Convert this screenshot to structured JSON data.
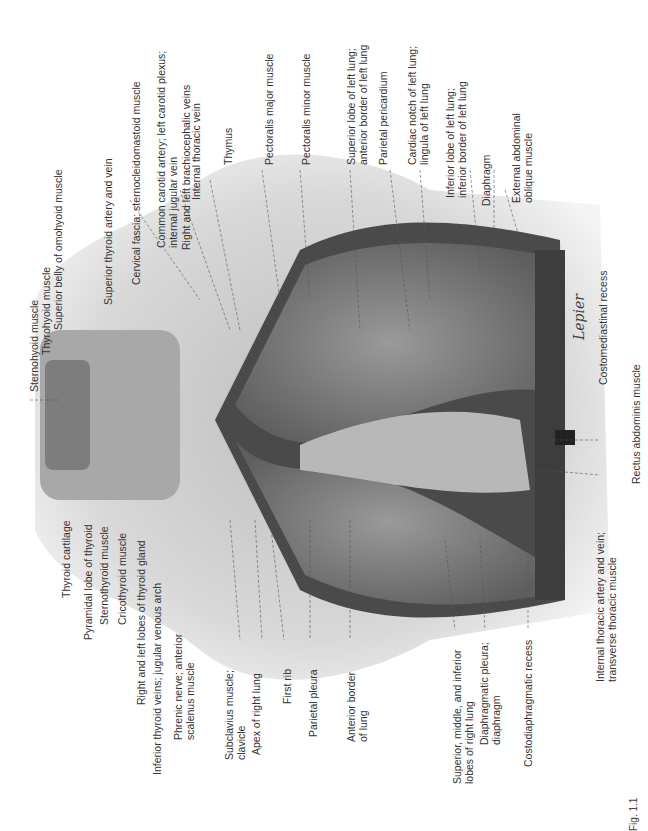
{
  "figure": {
    "caption_fragment": "Fig. 1.1",
    "signature": "Lepier"
  },
  "labels_top": [
    {
      "id": "sternohyoid",
      "text": "Sternohyoid muscle"
    },
    {
      "id": "thyrohyoid",
      "text": "Thyrohyoid muscle"
    },
    {
      "id": "omohyoid",
      "text": "Superior belly of omohyoid muscle"
    },
    {
      "id": "sup_thyroid",
      "text": "Superior thyroid artery and vein"
    },
    {
      "id": "cervical_fascia",
      "text": "Cervical fascia; sternocleidomastoid muscle"
    },
    {
      "id": "common_carotid",
      "text": "Common carotid artery; left carotid plexus;\ninternal jugular vein"
    },
    {
      "id": "brachiocephalic",
      "text": "Right and left brachiocephalic veins"
    },
    {
      "id": "int_thoracic_vein",
      "text": "Internal thoracic vein"
    },
    {
      "id": "thymus",
      "text": "Thymus"
    },
    {
      "id": "pect_major",
      "text": "Pectoralis major muscle"
    },
    {
      "id": "pect_minor",
      "text": "Pectoralis minor muscle"
    },
    {
      "id": "sup_lobe_left",
      "text": "Superior lobe of left lung;\nanterior border of left lung"
    },
    {
      "id": "parietal_pericardium",
      "text": "Parietal pericardium"
    },
    {
      "id": "cardiac_notch",
      "text": "Cardiac notch of left lung;\nlingula of left lung"
    },
    {
      "id": "inf_lobe_left",
      "text": "Inferior lobe of left lung;\ninferior border of left lung"
    },
    {
      "id": "diaphragm",
      "text": "Diaphragm"
    },
    {
      "id": "ext_oblique",
      "text": "External abdominal\noblique muscle"
    }
  ],
  "labels_bottom": [
    {
      "id": "thyroid_cartilage",
      "text": "Thyroid cartilage"
    },
    {
      "id": "pyramidal_lobe",
      "text": "Pyramidal lobe of thyroid"
    },
    {
      "id": "sternothyroid",
      "text": "Sternothyroid muscle"
    },
    {
      "id": "cricothyroid",
      "text": "Cricothyroid muscle"
    },
    {
      "id": "thyroid_lobes",
      "text": "Right and left lobes of thyroid gland"
    },
    {
      "id": "inf_thyroid_veins",
      "text": "Inferior thyroid veins; jugular venous arch"
    },
    {
      "id": "phrenic",
      "text": "Phrenic nerve; anterior\nscalenus muscle"
    },
    {
      "id": "subclavius",
      "text": "Subclavius muscle;\nclavicle"
    },
    {
      "id": "apex",
      "text": "Apex of right lung"
    },
    {
      "id": "first_rib",
      "text": "First rib"
    },
    {
      "id": "parietal_pleura",
      "text": "Parietal pleura"
    },
    {
      "id": "ant_border",
      "text": "Anterior border\nof lung"
    },
    {
      "id": "right_lobes",
      "text": "Superior, middle, and inferior\nlobes of right lung"
    },
    {
      "id": "diaph_pleura",
      "text": "Diaphragmatic pleura;\ndiaphragm"
    },
    {
      "id": "costodiaph",
      "text": "Costodiaphragmatic recess"
    },
    {
      "id": "int_thoracic_artery",
      "text": "Internal thoracic artery and vein;\ntransverse thoracic muscle"
    }
  ],
  "labels_right": [
    {
      "id": "costomediastinal",
      "text": "Costomediastinal recess"
    },
    {
      "id": "rectus",
      "text": "Rectus abdominis muscle"
    }
  ],
  "colors": {
    "background": "#ffffff",
    "skin": "#d9d9d9",
    "lung": "#7a7a7a",
    "dark": "#3a3a3a",
    "label": "#333333"
  }
}
